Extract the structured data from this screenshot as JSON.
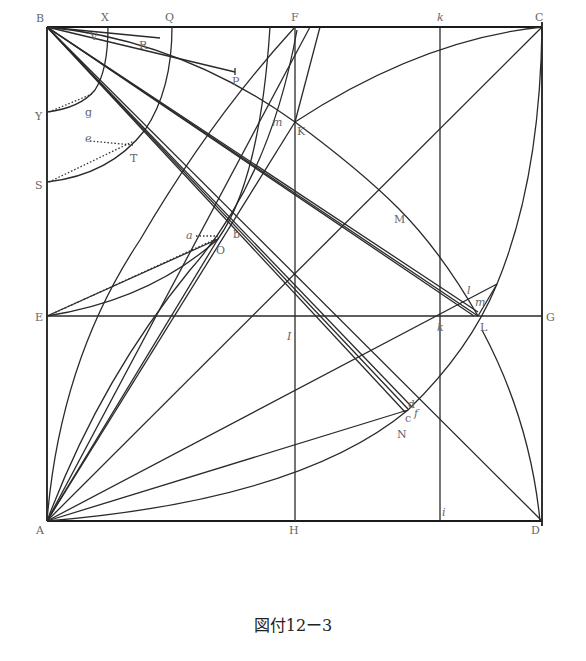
{
  "figure": {
    "caption": "図付12ー3",
    "points": {
      "B": "B",
      "X": "X",
      "Q": "Q",
      "F": "F",
      "k_top": "k",
      "C": "C",
      "V": "V",
      "R": "R",
      "P": "P",
      "Y": "Y",
      "g": "g",
      "S": "S",
      "e": "e",
      "T": "T",
      "m_upper": "m",
      "K": "K",
      "M": "M",
      "a": "a",
      "b": "b",
      "O": "O",
      "E": "E",
      "I": "I",
      "k_mid": "k",
      "L": "L",
      "G": "G",
      "l": "l",
      "m_lower": "m",
      "d": "d",
      "f": "f",
      "c": "c",
      "N": "N",
      "A": "A",
      "H": "H",
      "i": "i",
      "D": "D"
    }
  }
}
